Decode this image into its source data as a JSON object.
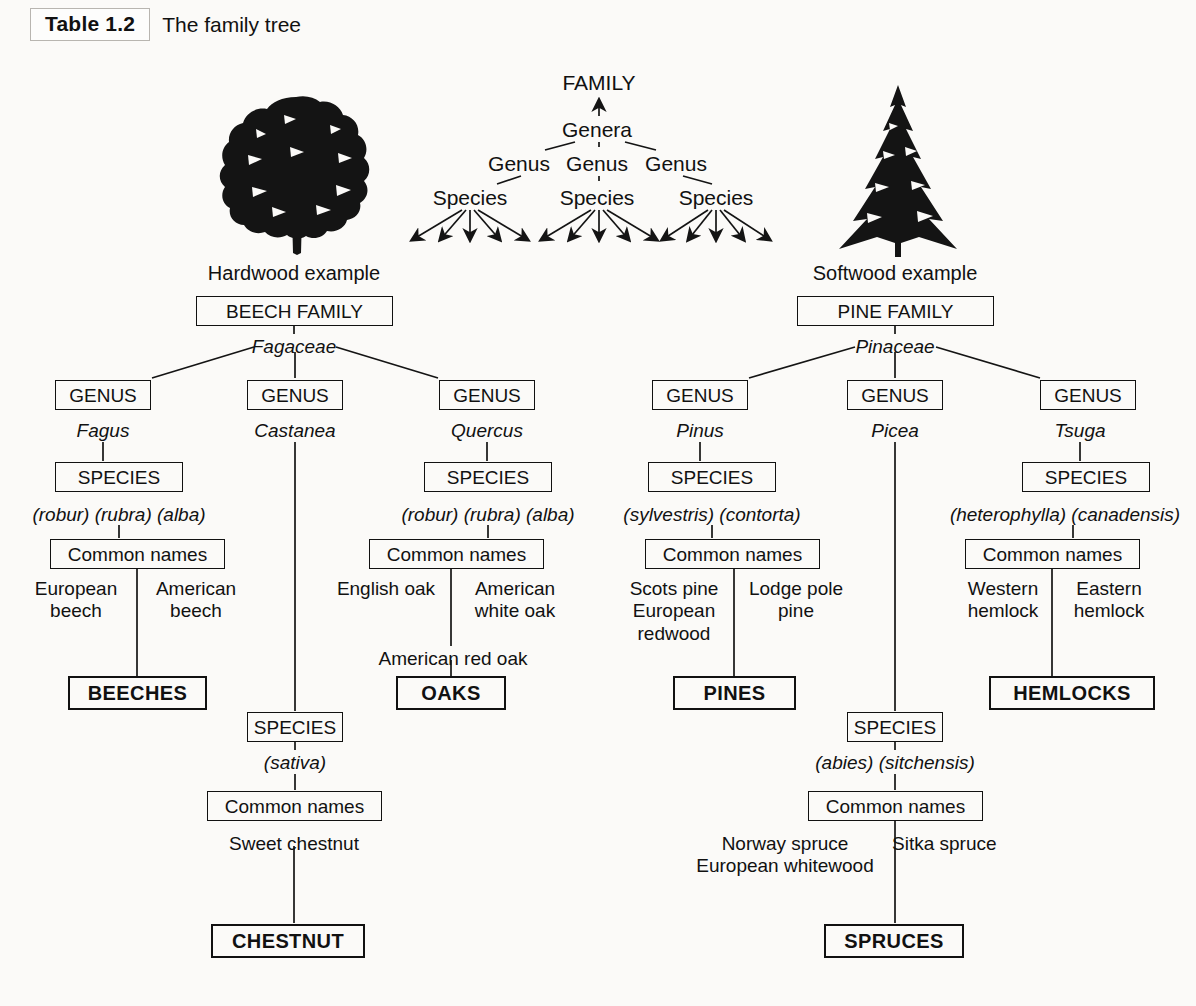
{
  "caption": {
    "tag": "Table 1.2",
    "text": "The family tree"
  },
  "concept_tree": {
    "family": "FAMILY",
    "genera": "Genera",
    "genus_labels": [
      "Genus",
      "Genus",
      "Genus"
    ],
    "species_labels": [
      "Species",
      "Species",
      "Species"
    ]
  },
  "examples": {
    "hardwood": {
      "caption": "Hardwood example",
      "family_box": "BEECH FAMILY",
      "family_latin": "Fagaceae",
      "tree_icon": "broadleaf-tree-icon",
      "branches": [
        {
          "genus_box": "GENUS",
          "genus_latin": "Fagus",
          "species_box": "SPECIES",
          "species_epithets": "(robur) (rubra) (alba)",
          "common_box": "Common names",
          "common_left": [
            "European",
            "beech"
          ],
          "common_right": [
            "American",
            "beech"
          ],
          "common_extra": "",
          "result": "BEECHES"
        },
        {
          "genus_box": "GENUS",
          "genus_latin": "Castanea",
          "species_box": "SPECIES",
          "species_epithets": "(sativa)",
          "common_box": "Common names",
          "common_center": "Sweet chestnut",
          "result": "CHESTNUT"
        },
        {
          "genus_box": "GENUS",
          "genus_latin": "Quercus",
          "species_box": "SPECIES",
          "species_epithets": "(robur) (rubra) (alba)",
          "common_box": "Common names",
          "common_left": [
            "English oak"
          ],
          "common_right": [
            "American",
            "white oak"
          ],
          "common_extra": "American red oak",
          "result": "OAKS"
        }
      ]
    },
    "softwood": {
      "caption": "Softwood example",
      "family_box": "PINE FAMILY",
      "family_latin": "Pinaceae",
      "tree_icon": "conifer-tree-icon",
      "branches": [
        {
          "genus_box": "GENUS",
          "genus_latin": "Pinus",
          "species_box": "SPECIES",
          "species_epithets": "(sylvestris) (contorta)",
          "common_box": "Common names",
          "common_left": [
            "Scots pine",
            "European",
            "redwood"
          ],
          "common_right": [
            "Lodge pole",
            "pine"
          ],
          "common_extra": "",
          "result": "PINES"
        },
        {
          "genus_box": "GENUS",
          "genus_latin": "Picea",
          "species_box": "SPECIES",
          "species_epithets": "(abies) (sitchensis)",
          "common_box": "Common names",
          "common_left": [
            "Norway spruce",
            "European whitewood"
          ],
          "common_right": [
            "Sitka spruce"
          ],
          "result": "SPRUCES"
        },
        {
          "genus_box": "GENUS",
          "genus_latin": "Tsuga",
          "species_box": "SPECIES",
          "species_epithets": "(heterophylla) (canadensis)",
          "common_box": "Common names",
          "common_left": [
            "Western",
            "hemlock"
          ],
          "common_right": [
            "Eastern",
            "hemlock"
          ],
          "common_extra": "",
          "result": "HEMLOCKS"
        }
      ]
    }
  },
  "colors": {
    "ink": "#111111",
    "paper": "#fbfaf8",
    "rule": "#b8b5b0"
  }
}
